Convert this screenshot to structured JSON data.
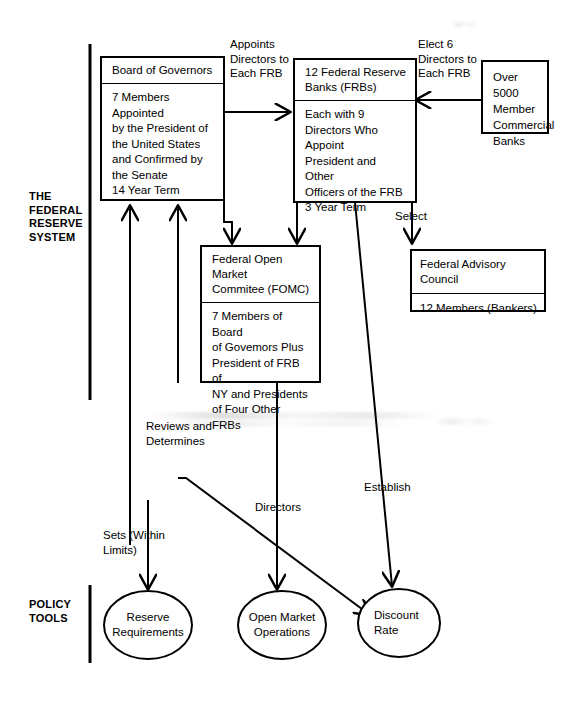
{
  "diagram": {
    "title": "The Federal Reserve System",
    "sections": [
      {
        "id": "federal-reserve-system",
        "label": "THE\nFEDERAL\nRESERVE\nSYSTEM"
      },
      {
        "id": "policy-tools",
        "label": "POLICY\nTOOLS"
      }
    ],
    "boxes": [
      {
        "id": "board-of-governors",
        "title": "Board of Governors",
        "body": "7 Members Appointed\nby the President of\nthe United States\nand Confirmed by\nthe Senate\n14 Year Term"
      },
      {
        "id": "federal-reserve-banks",
        "title": "12 Federal Reserve\nBanks (FRBs)",
        "body": "Each with 9\nDirectors Who Appoint\nPresident and Other\nOfficers of the FRB\n3 Year Term"
      },
      {
        "id": "member-commercial-banks",
        "title": "",
        "body": "Over 5000\nMember\nCommercial\nBanks"
      },
      {
        "id": "fomc",
        "title": "Federal Open Market\nCommitee (FOMC)",
        "body": "7 Members of Board\nof Govemors Plus\nPresident of FRB of\nNY and Presidents\nof Four Other FRBs"
      },
      {
        "id": "federal-advisory-council",
        "title": "Federal Advisory Council",
        "body": "12 Members (Bankers)"
      }
    ],
    "ellipses": [
      {
        "id": "reserve-requirements",
        "label": "Reserve\nRequirements"
      },
      {
        "id": "open-market-operations",
        "label": "Open Market\nOperations"
      },
      {
        "id": "discount-rate",
        "label": "Discount\nRate"
      }
    ],
    "connector_labels": [
      {
        "id": "appoints-directors",
        "text": "Appoints\nDirectors to\nEach FRB"
      },
      {
        "id": "elect-six-directors",
        "text": "Elect 6\nDirectors to\nEach FRB"
      },
      {
        "id": "select",
        "text": "Select"
      },
      {
        "id": "reviews-and-determines",
        "text": "Reviews and\nDetermines"
      },
      {
        "id": "directors",
        "text": "Directors"
      },
      {
        "id": "establish",
        "text": "Establish"
      },
      {
        "id": "sets-within-limits",
        "text": "Sets (Within\nLimits)"
      }
    ],
    "colors": {
      "stroke": "#000000",
      "background": "#ffffff",
      "text": "#000000"
    }
  }
}
